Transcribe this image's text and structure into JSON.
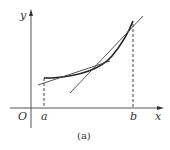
{
  "figure": {
    "caption": "(a)",
    "axes": {
      "x_label": "x",
      "y_label": "y",
      "origin_label": "O"
    },
    "points": {
      "a_label": "a",
      "b_label": "b"
    },
    "elements": [
      "x-axis with arrow",
      "y-axis with arrow",
      "convex curve from x=a to x=b",
      "dashed vertical line at a",
      "dashed vertical line at b",
      "tangent line near left portion of curve",
      "tangent line near right portion of curve"
    ],
    "colors": {
      "line": "#333333",
      "axis": "#555555"
    }
  }
}
